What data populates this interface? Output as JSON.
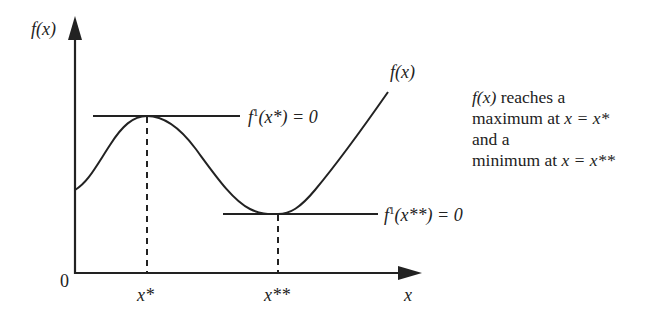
{
  "axes": {
    "y_label": "f(x)",
    "x_label": "x",
    "origin_label": "0"
  },
  "ticks": {
    "x_star": "x*",
    "x_double_star": "x**"
  },
  "curve_label": "f(x)",
  "tangents": {
    "max": {
      "f": "f",
      "sup": "1",
      "arg": "(x*) = 0"
    },
    "min": {
      "f": "f",
      "sup": "1",
      "arg": "(x**) = 0"
    }
  },
  "note": {
    "line1_fx": "f(x)",
    "line1_rest": " reaches a",
    "line2_prefix": "maximum at ",
    "line2_math": "x = x*",
    "line3": "and a",
    "line4_prefix": "minimum at ",
    "line4_math": "x = x**"
  },
  "colors": {
    "ink": "#222222",
    "background": "#ffffff"
  }
}
